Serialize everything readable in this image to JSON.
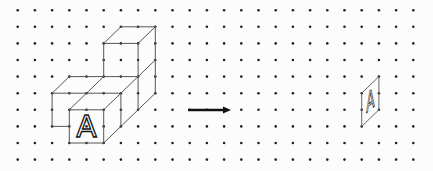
{
  "figure": {
    "grid": {
      "columns": 24,
      "rows": 10,
      "origin_x": 17.7,
      "origin_y": 10.2,
      "spacing_x": 17.2,
      "spacing_y": 16.6,
      "dot_color": "#222222"
    },
    "solid": {
      "label": "A",
      "edge_color": "#555555",
      "edges": [
        [
          [
            6,
            1
          ],
          [
            8,
            1
          ]
        ],
        [
          [
            5,
            2
          ],
          [
            7,
            2
          ]
        ],
        [
          [
            5,
            2
          ],
          [
            6,
            1
          ]
        ],
        [
          [
            7,
            2
          ],
          [
            8,
            1
          ]
        ],
        [
          [
            5,
            2
          ],
          [
            5,
            4
          ]
        ],
        [
          [
            7,
            2
          ],
          [
            7,
            6
          ]
        ],
        [
          [
            8,
            1
          ],
          [
            8,
            5
          ]
        ],
        [
          [
            8,
            3
          ],
          [
            7,
            4
          ]
        ],
        [
          [
            8,
            5
          ],
          [
            7,
            6
          ]
        ],
        [
          [
            3,
            4
          ],
          [
            7,
            4
          ]
        ],
        [
          [
            2,
            5
          ],
          [
            6,
            5
          ]
        ],
        [
          [
            2,
            5
          ],
          [
            3,
            4
          ]
        ],
        [
          [
            4,
            5
          ],
          [
            5,
            4
          ]
        ],
        [
          [
            6,
            5
          ],
          [
            7,
            4
          ]
        ],
        [
          [
            2,
            5
          ],
          [
            2,
            7
          ]
        ],
        [
          [
            2,
            7
          ],
          [
            3,
            7
          ]
        ],
        [
          [
            3,
            6
          ],
          [
            5,
            6
          ]
        ],
        [
          [
            3,
            6
          ],
          [
            3,
            8
          ]
        ],
        [
          [
            5,
            6
          ],
          [
            5,
            8
          ]
        ],
        [
          [
            3,
            8
          ],
          [
            5,
            8
          ]
        ],
        [
          [
            3,
            6
          ],
          [
            4,
            5
          ]
        ],
        [
          [
            5,
            6
          ],
          [
            6,
            5
          ]
        ],
        [
          [
            6,
            5
          ],
          [
            6,
            7
          ]
        ],
        [
          [
            6,
            7
          ],
          [
            5,
            8
          ]
        ],
        [
          [
            7,
            6
          ],
          [
            6,
            7
          ]
        ]
      ],
      "letter_box": [
        [
          3,
          6
        ],
        [
          5,
          8
        ]
      ]
    },
    "arrow": {
      "from": [
        188,
        110
      ],
      "to": [
        231,
        110
      ],
      "color": "#111111"
    },
    "result": {
      "label": "A",
      "edge_color": "#666666",
      "polygon": [
        [
          21,
          4
        ],
        [
          21,
          6
        ],
        [
          20,
          7
        ],
        [
          20,
          5
        ]
      ]
    }
  }
}
